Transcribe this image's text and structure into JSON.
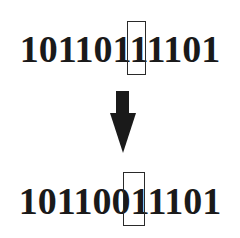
{
  "diagram": {
    "before": {
      "bits": "10110111101",
      "highlighted_index": 5,
      "highlighted_bit": "1"
    },
    "arrow": {
      "direction": "down",
      "icon": "arrow-down-icon"
    },
    "after": {
      "bits": "10110011101",
      "highlighted_index": 5,
      "highlighted_bit": "0"
    },
    "colors": {
      "text": "#1a1a1a",
      "background": "#ffffff"
    }
  }
}
